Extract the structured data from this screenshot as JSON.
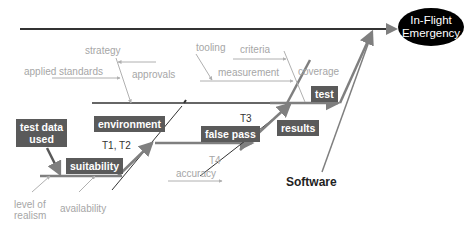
{
  "effect": {
    "line1": "In-Flight",
    "line2": "Emergency"
  },
  "category": "Software",
  "boxes": {
    "test_data_used_1": "test data",
    "test_data_used_2": "used",
    "suitability": "suitability",
    "environment": "environment",
    "false_pass": "false pass",
    "results": "results",
    "test": "test"
  },
  "labels": {
    "strategy": "strategy",
    "applied_standards": "applied standards",
    "approvals": "approvals",
    "tooling": "tooling",
    "criteria": "criteria",
    "measurement": "measurement",
    "coverage": "coverage",
    "t1_t2": "T1, T2",
    "t3": "T3",
    "t4": "T4",
    "accuracy": "accuracy",
    "level_of_1": "level of",
    "level_of_2": "realism",
    "availability": "availability"
  },
  "colors": {
    "box": "#5a5a5a",
    "spine": "#333333",
    "branch": "#7f7f7f",
    "minor": "#b0b0b0"
  }
}
